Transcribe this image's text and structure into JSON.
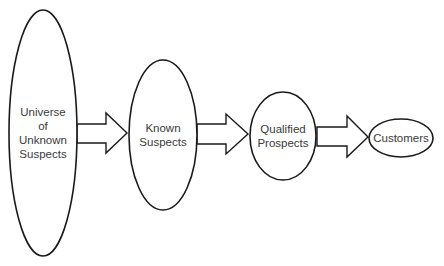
{
  "diagram": {
    "type": "funnel-flow",
    "direction": "left-to-right",
    "stages": [
      {
        "id": "universe",
        "label_lines": [
          "Universe",
          "of",
          "Unknown",
          "Suspects"
        ],
        "shape": "ellipse",
        "cx": 43,
        "cy": 133,
        "rx": 34,
        "ry": 123
      },
      {
        "id": "known",
        "label_lines": [
          "Known",
          "Suspects"
        ],
        "shape": "ellipse",
        "cx": 163,
        "cy": 135,
        "rx": 34,
        "ry": 75
      },
      {
        "id": "qualified",
        "label_lines": [
          "Qualified",
          "Prospects"
        ],
        "shape": "ellipse",
        "cx": 283,
        "cy": 136,
        "rx": 33,
        "ry": 44
      },
      {
        "id": "customers",
        "label_lines": [
          "Customers"
        ],
        "shape": "ellipse",
        "cx": 401,
        "cy": 138,
        "rx": 32,
        "ry": 19
      }
    ],
    "arrows": [
      {
        "from": "universe",
        "to": "known",
        "shaft_x1": 77,
        "shaft_x2": 106,
        "shaft_top": 124,
        "shaft_bottom": 143,
        "head_top": 113,
        "head_bottom": 153,
        "tip_x": 127,
        "tip_y": 133
      },
      {
        "from": "known",
        "to": "qualified",
        "shaft_x1": 197,
        "shaft_x2": 226,
        "shaft_top": 124,
        "shaft_bottom": 144,
        "head_top": 114,
        "head_bottom": 154,
        "tip_x": 248,
        "tip_y": 134
      },
      {
        "from": "qualified",
        "to": "customers",
        "shaft_x1": 317,
        "shaft_x2": 347,
        "shaft_top": 127,
        "shaft_bottom": 146,
        "head_top": 116,
        "head_bottom": 157,
        "tip_x": 368,
        "tip_y": 137
      }
    ],
    "colors": {
      "stroke": "#1a1a1a",
      "fill": "#ffffff",
      "text": "#3a3a3a",
      "background": "#ffffff"
    }
  }
}
